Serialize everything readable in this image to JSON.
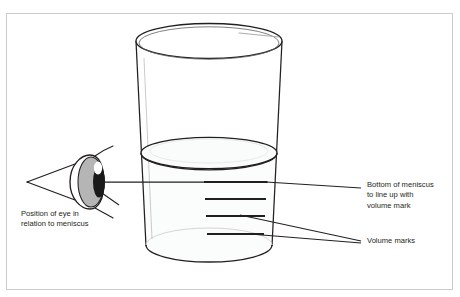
{
  "figure": {
    "type": "diagram",
    "background_color": "#ffffff",
    "frame_border_color": "#c9ccd1",
    "ink_color": "#231f20",
    "residual_text_above_figure": "· · ·",
    "beaker": {
      "name": "beaker",
      "outline_color": "#231f20",
      "glass_fill": "#ffffff",
      "water_fill": "#fbfcfc",
      "highlight_color": "#b9bcc0",
      "rim_ellipse": {
        "cx": 212,
        "cy": 40,
        "rx": 78,
        "ry": 18
      },
      "base_ellipse": {
        "cx": 212,
        "cy": 253,
        "rx": 66,
        "ry": 16
      },
      "water_surface_ellipse": {
        "cx": 211,
        "cy": 152,
        "rx": 71,
        "ry": 16
      }
    },
    "meniscus": {
      "name": "meniscus",
      "bottom_y": 181,
      "description": "curved top surface of the liquid"
    },
    "volume_marks": {
      "name": "volume-marks",
      "count": 4,
      "color": "#231f20",
      "y_positions": [
        181,
        198,
        215,
        233
      ],
      "x_start": 212,
      "x_end": 268
    },
    "eye": {
      "name": "eye",
      "outline_color": "#231f20",
      "iris_color": "#b5b5b5",
      "pupil_color": "#1a1a1a",
      "highlight_color": "#ffffff",
      "center_x": 85,
      "center_y": 180
    },
    "sight_line": {
      "name": "sight-line",
      "from_x": 26,
      "from_y": 180,
      "to_x": 268,
      "to_y": 180,
      "color": "#231f20"
    }
  },
  "labels": {
    "eye_position": {
      "text": "Position of eye in\nrelation to meniscus",
      "leader_from": {
        "x": 118,
        "y": 202
      },
      "leader_to": {
        "x": 96,
        "y": 189
      }
    },
    "meniscus_bottom": {
      "text": "Bottom of meniscus\nto line up with\nvolume mark",
      "leader_from": {
        "x": 360,
        "y": 186
      },
      "leader_to": {
        "x": 270,
        "y": 181
      }
    },
    "volume_marks": {
      "text": "Volume marks",
      "leader_from": {
        "x": 360,
        "y": 239
      },
      "leader_to_upper": {
        "x": 247,
        "y": 213
      },
      "leader_to_lower": {
        "x": 256,
        "y": 232
      }
    }
  }
}
